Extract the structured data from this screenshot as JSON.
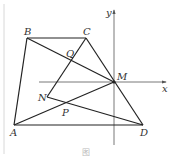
{
  "figure": {
    "caption": "图",
    "axes": {
      "x_label": "x",
      "y_label": "y"
    },
    "points": {
      "A": "A",
      "B": "B",
      "C": "C",
      "D": "D",
      "M": "M",
      "N": "N",
      "P": "P",
      "Q": "Q"
    },
    "segments": [
      "AB",
      "BC",
      "CD",
      "DA",
      "BM",
      "AM",
      "CN",
      "ND"
    ]
  }
}
